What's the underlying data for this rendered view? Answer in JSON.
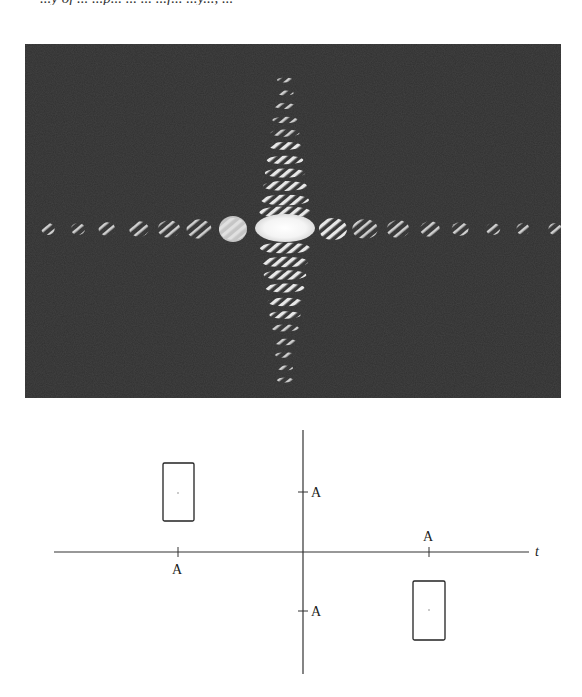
{
  "page": {
    "clipped_header_text": "...y of ... ...p... ... ...  ...f... ...y..., ..."
  },
  "figure_photo": {
    "description": "Optical diffraction pattern (Fourier transform) of a rectangular aperture pair, showing a bright central lobe with a horizontal row and vertical column of hatched fringe spots on a dark background",
    "background_color": "#2f2f2f",
    "spot_color": "#e6e6e6",
    "center": {
      "x": 285,
      "y": 228
    },
    "horizontal_spots_x": [
      48,
      78,
      107,
      139,
      169,
      199,
      233,
      333,
      365,
      398,
      430,
      460,
      493,
      523,
      555
    ],
    "vertical_rows_y": [
      80,
      93,
      106,
      120,
      133,
      146,
      160,
      173,
      186,
      200,
      212,
      248,
      262,
      275,
      288,
      302,
      315,
      328,
      342,
      355,
      368,
      380
    ]
  },
  "figure_diagram": {
    "axis_labels": {
      "t": "t"
    },
    "tick_labels": {
      "left_x": "A",
      "right_x": "A",
      "upper_y": "A",
      "lower_y": "A"
    },
    "rects": [
      {
        "name": "upper-left-rect",
        "x": 163,
        "y": 463,
        "w": 31,
        "h": 58
      },
      {
        "name": "lower-right-rect",
        "x": 413,
        "y": 581,
        "w": 32,
        "h": 59
      }
    ]
  }
}
